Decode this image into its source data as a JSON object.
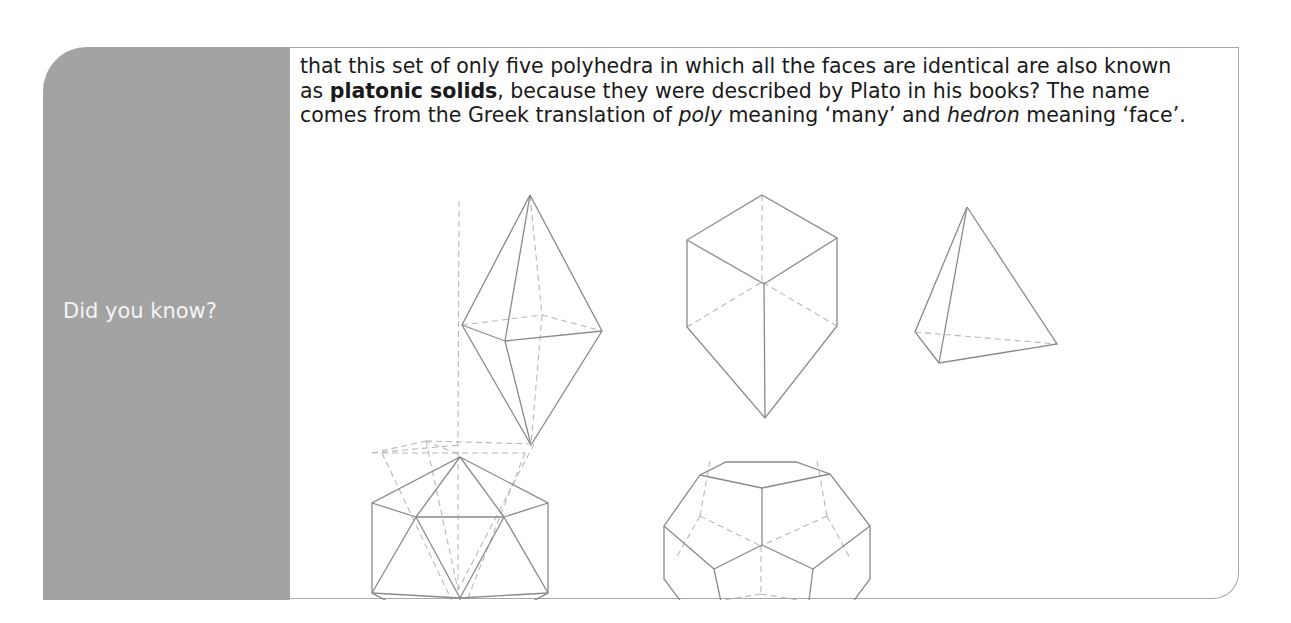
{
  "callout": {
    "label": "Did you know?",
    "text": {
      "part1": "that this set of only five polyhedra in which all the faces are identical are also known as ",
      "bold": "platonic solids",
      "part2": ", because they were described by Plato in his books? The name comes from the Greek translation of ",
      "italic1": "poly",
      "part3": " meaning ‘many’ and ",
      "italic2": "hedron",
      "part4": " meaning ‘face’."
    },
    "figures": [
      {
        "name": "octahedron"
      },
      {
        "name": "cube"
      },
      {
        "name": "tetrahedron"
      },
      {
        "name": "icosahedron"
      },
      {
        "name": "dodecahedron"
      }
    ],
    "colors": {
      "sidebar": "#a3a3a3",
      "border": "#a8a8a8",
      "label": "#f4f4f4",
      "text": "#1a1a1a"
    }
  }
}
